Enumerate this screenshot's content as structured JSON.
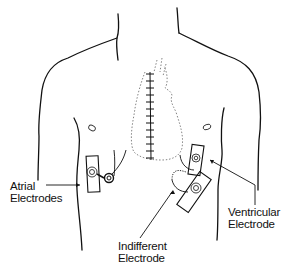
{
  "diagram": {
    "colors": {
      "line": "#111111",
      "dotted": "#555555",
      "background": "#ffffff"
    },
    "labels": {
      "atrial": {
        "line1": "Atrial",
        "line2": "Electrodes"
      },
      "ventricular": {
        "line1": "Ventricular",
        "line2": "Electrode"
      },
      "indifferent": {
        "line1": "Indifferent",
        "line2": "Electrode"
      }
    },
    "elements": [
      "torso-outline",
      "neck",
      "shoulders",
      "nipples",
      "sternotomy-incision-sutures",
      "heart-outline-dotted",
      "atrial-electrode-pad",
      "atrial-wire-coils",
      "ventricular-electrode-pad",
      "indifferent-electrode-pad"
    ]
  }
}
